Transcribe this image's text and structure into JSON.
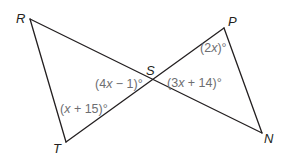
{
  "diagram": {
    "type": "two triangles sharing vertex S (vertical angles)",
    "colors": {
      "line": "#231f20",
      "vertex_label": "#231f20",
      "angle_label": "#6d6e71",
      "background": "#ffffff"
    },
    "vertices": {
      "R": {
        "label": "R",
        "x": 30,
        "y": 19
      },
      "P": {
        "label": "P",
        "x": 224,
        "y": 28
      },
      "S": {
        "label": "S",
        "x": 152,
        "y": 80
      },
      "T": {
        "label": "T",
        "x": 66,
        "y": 142
      },
      "N": {
        "label": "N",
        "x": 262,
        "y": 133
      }
    },
    "segments": [
      {
        "from": "R",
        "to": "N"
      },
      {
        "from": "T",
        "to": "P"
      },
      {
        "from": "R",
        "to": "T"
      },
      {
        "from": "P",
        "to": "N"
      }
    ],
    "angles": {
      "T": {
        "vertex": "T",
        "pre": "(",
        "var": "x",
        "post": " + 15)°",
        "text": "(x + 15)°"
      },
      "RST": {
        "vertex": "S",
        "pre": "(4",
        "var": "x",
        "post": " − 1)°",
        "text": "(4x − 1)°"
      },
      "PSN": {
        "vertex": "S",
        "pre": "(3",
        "var": "x",
        "post": " + 14)°",
        "text": "(3x + 14)°"
      },
      "P": {
        "vertex": "P",
        "pre": "(2",
        "var": "x",
        "post": ")°",
        "text": "(2x)°"
      }
    }
  }
}
